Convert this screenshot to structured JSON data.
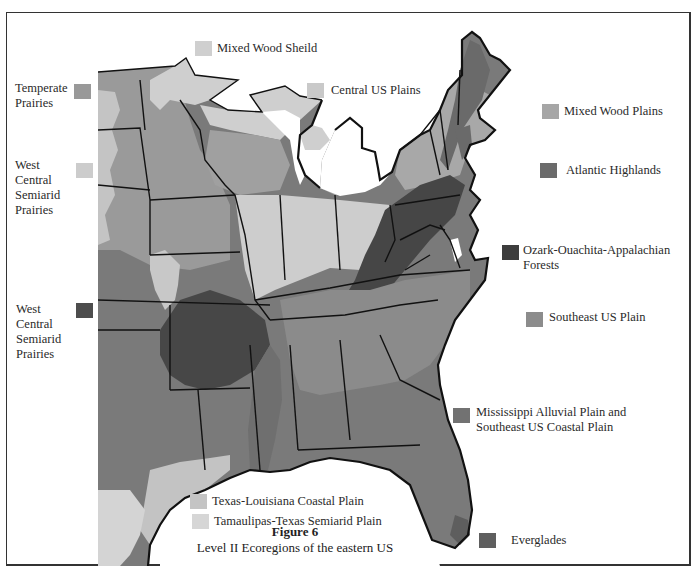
{
  "figure": {
    "title": "Figure 6",
    "subtitle": "Level II Ecoregions of the eastern US"
  },
  "colors": {
    "background": "#ffffff",
    "state_border": "#111111",
    "very_light": "#d3d3d3",
    "light": "#c6c6c6",
    "medium_light": "#a9a9a9",
    "medium": "#8c8c8c",
    "medium_dark": "#707070",
    "dark": "#5e5e5e",
    "darkest": "#474747"
  },
  "legend": [
    {
      "id": "mixed-wood-shield",
      "label": "Mixed Wood Sheild",
      "color": "#cfcfcf"
    },
    {
      "id": "central-us-plains",
      "label": "Central US Plains",
      "color": "#c9c9c9"
    },
    {
      "id": "temperate-prairies",
      "label": "Temperate\nPrairies",
      "color": "#999999"
    },
    {
      "id": "west-central-semiarid-prairies-light",
      "label": "West\nCentral\nSemiarid\nPrairies",
      "color": "#cccccc"
    },
    {
      "id": "west-central-semiarid-prairies-dark",
      "label": "West\nCentral\nSemiarid\nPrairies",
      "color": "#4d4d4d"
    },
    {
      "id": "mixed-wood-plains",
      "label": "Mixed Wood Plains",
      "color": "#a6a6a6"
    },
    {
      "id": "atlantic-highlands",
      "label": "Atlantic Highlands",
      "color": "#6b6b6b"
    },
    {
      "id": "ozark-ouachita-appalachian-forests",
      "label": "Ozark-Ouachita-Appalachian\nForests",
      "color": "#3d3d3d"
    },
    {
      "id": "southeast-us-plain",
      "label": "Southeast US Plain",
      "color": "#8c8c8c"
    },
    {
      "id": "mississippi-alluvial-southeast-coastal-plain",
      "label": "Mississippi Alluvial Plain and\nSoutheast US Coastal Plain",
      "color": "#727272"
    },
    {
      "id": "texas-louisiana-coastal-plain",
      "label": "Texas-Louisiana Coastal Plain",
      "color": "#c4c4c4"
    },
    {
      "id": "tamaulipas-texas-semiarid-plain",
      "label": "Tamaulipas-Texas Semiarid Plain",
      "color": "#d6d6d6"
    },
    {
      "id": "everglades",
      "label": "Everglades",
      "color": "#5f5f5f"
    }
  ]
}
